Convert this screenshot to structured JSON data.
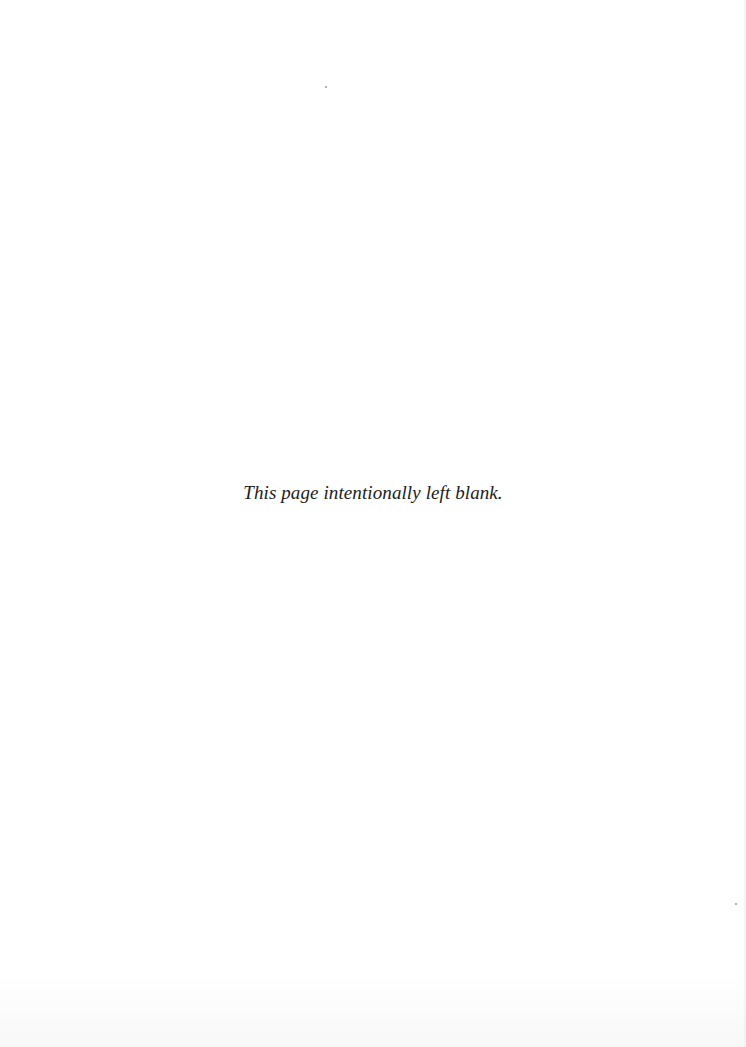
{
  "page": {
    "background_color": "#ffffff",
    "notice_text": "This page intentionally left blank.",
    "text_color": "#1c1c1c"
  }
}
